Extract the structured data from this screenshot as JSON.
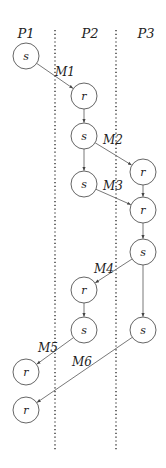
{
  "processes": [
    {
      "id": "P1",
      "label": "P1",
      "x": 26
    },
    {
      "id": "P2",
      "label": "P2",
      "x": 90
    },
    {
      "id": "P3",
      "label": "P3",
      "x": 146
    }
  ],
  "lanes": [
    {
      "x": 55,
      "y1": 30,
      "y2": 450
    },
    {
      "x": 116,
      "y1": 30,
      "y2": 450
    }
  ],
  "nodes": [
    {
      "id": "n1",
      "label": "s",
      "process": "P1",
      "x": 26,
      "y": 56
    },
    {
      "id": "n2",
      "label": "r",
      "process": "P2",
      "x": 84,
      "y": 96
    },
    {
      "id": "n3",
      "label": "s",
      "process": "P2",
      "x": 84,
      "y": 136
    },
    {
      "id": "n4",
      "label": "s",
      "process": "P2",
      "x": 84,
      "y": 184
    },
    {
      "id": "n5",
      "label": "r",
      "process": "P3",
      "x": 143,
      "y": 172
    },
    {
      "id": "n6",
      "label": "r",
      "process": "P3",
      "x": 143,
      "y": 210
    },
    {
      "id": "n7",
      "label": "s",
      "process": "P3",
      "x": 143,
      "y": 252
    },
    {
      "id": "n8",
      "label": "r",
      "process": "P2",
      "x": 84,
      "y": 290
    },
    {
      "id": "n9",
      "label": "s",
      "process": "P2",
      "x": 84,
      "y": 330
    },
    {
      "id": "n10",
      "label": "s",
      "process": "P3",
      "x": 143,
      "y": 330
    },
    {
      "id": "n11",
      "label": "r",
      "process": "P1",
      "x": 26,
      "y": 372
    },
    {
      "id": "n12",
      "label": "r",
      "process": "P1",
      "x": 26,
      "y": 410
    }
  ],
  "messages": [
    {
      "label": "M1",
      "from": "n1",
      "to": "n2",
      "label_x": 55,
      "label_y": 76
    },
    {
      "label": "M2",
      "from": "n3",
      "to": "n5",
      "label_x": 103,
      "label_y": 144
    },
    {
      "label": "M3",
      "from": "n4",
      "to": "n6",
      "label_x": 103,
      "label_y": 190
    },
    {
      "label": "M4",
      "from": "n7",
      "to": "n8",
      "label_x": 94,
      "label_y": 273
    },
    {
      "label": "M5",
      "from": "n9",
      "to": "n11",
      "label_x": 38,
      "label_y": 352
    },
    {
      "label": "M6",
      "from": "n10",
      "to": "n12",
      "label_x": 72,
      "label_y": 366
    }
  ],
  "local_edges": [
    {
      "from": "n2",
      "to": "n3"
    },
    {
      "from": "n3",
      "to": "n4"
    },
    {
      "from": "n5",
      "to": "n6"
    },
    {
      "from": "n6",
      "to": "n7"
    },
    {
      "from": "n7",
      "to": "n10"
    },
    {
      "from": "n8",
      "to": "n9"
    }
  ],
  "node_radius": 13
}
